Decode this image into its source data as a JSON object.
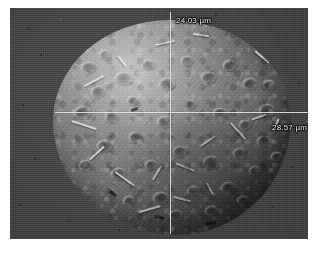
{
  "image": {
    "kind": "sem-micrograph",
    "subject": "spherical porous particle",
    "background_color": "#3e3e3e",
    "annotation_color": "#f2f2f2"
  },
  "measurements": {
    "vertical": {
      "label": "24.03 µm",
      "value": 24.03,
      "unit": "µm",
      "orientation": "vertical"
    },
    "horizontal": {
      "label": "28.57 µm",
      "value": 28.57,
      "unit": "µm",
      "orientation": "horizontal"
    }
  },
  "overlay": {
    "crosshair": {
      "center_x": 170,
      "center_y": 112,
      "line_color": "#e9e9e9"
    }
  }
}
